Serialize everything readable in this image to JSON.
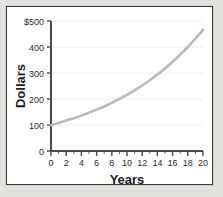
{
  "figure": {
    "background_color": "#e3e2df",
    "paper_color": "#ffffff",
    "border_color": "#3a3a3a"
  },
  "chart_data": {
    "type": "line",
    "title": "",
    "subtitle": "",
    "xlabel": "Years",
    "ylabel": "Dollars",
    "xlim": [
      0,
      20
    ],
    "ylim": [
      0,
      500
    ],
    "grid": true,
    "grid_axis": "y",
    "legend": false,
    "legend_position": "none",
    "series_color": "#b9b9b9",
    "axis_color": "#4a4a4a",
    "x_tick_labels": [
      "0",
      "2",
      "4",
      "6",
      "8",
      "10",
      "12",
      "14",
      "16",
      "18",
      "20"
    ],
    "x_tick_values": [
      0,
      2,
      4,
      6,
      8,
      10,
      12,
      14,
      16,
      18,
      20
    ],
    "x_minor_tick_step": 1,
    "y_tick_labels": [
      "0",
      "100",
      "200",
      "300",
      "400",
      "$500"
    ],
    "y_tick_values": [
      0,
      100,
      200,
      300,
      400,
      500
    ],
    "series": [
      {
        "name": "Compound growth",
        "x": [
          0,
          1,
          2,
          3,
          4,
          5,
          6,
          7,
          8,
          9,
          10,
          11,
          12,
          13,
          14,
          15,
          16,
          17,
          18,
          19,
          20
        ],
        "values": [
          100,
          108,
          117,
          126,
          136,
          147,
          159,
          171,
          185,
          200,
          216,
          233,
          252,
          272,
          294,
          317,
          343,
          370,
          400,
          432,
          466
        ]
      }
    ]
  }
}
